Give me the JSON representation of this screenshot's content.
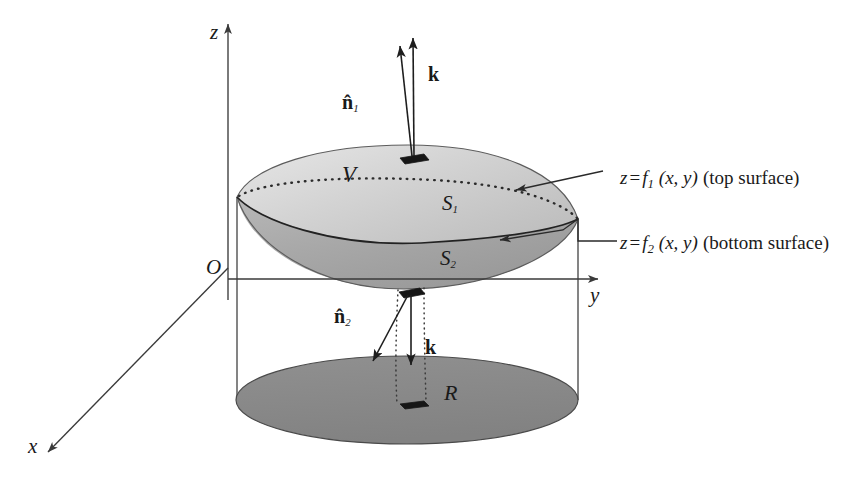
{
  "figure": {
    "colors": {
      "blob_top": "#cbcbcb",
      "blob_bottom": "#a0a0a0",
      "region_r": "#8a8a8a",
      "line": "#3a3a3a",
      "text": "#1a1a1a"
    }
  },
  "axes": {
    "z_label": "z",
    "y_label": "y",
    "x_label": "x",
    "origin_label": "O"
  },
  "labels": {
    "volume": "V",
    "surface_top": "S",
    "surface_top_sub": "1",
    "surface_bottom": "S",
    "surface_bottom_sub": "2",
    "region": "R",
    "normal_top": "n̂",
    "normal_top_sub": "1",
    "normal_bottom": "n̂",
    "normal_bottom_sub": "2",
    "k_top": "k",
    "k_bottom": "k"
  },
  "annotations": {
    "top_surface": {
      "z": "z",
      "equals": "=",
      "f": "f",
      "sub": "1",
      "args": "(x, y)",
      "note": "(top surface)",
      "full": "z = f1 (x, y) (top surface)"
    },
    "bottom_surface": {
      "z": "z",
      "equals": "=",
      "f": "f",
      "sub": "2",
      "args": "(x, y)",
      "note": "(bottom surface)",
      "full": "z = f2 (x, y) (bottom surface)"
    }
  }
}
